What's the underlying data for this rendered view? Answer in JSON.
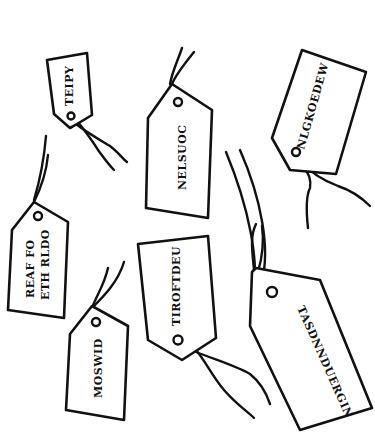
{
  "scene": {
    "description": "Hand-drawn luggage tags with scrambled words",
    "background": "#ffffff",
    "ink": "#111111"
  },
  "tags": [
    {
      "id": "tag-1",
      "lines": [
        "TEIPY"
      ]
    },
    {
      "id": "tag-2",
      "lines": [
        "NELSUOC"
      ]
    },
    {
      "id": "tag-3",
      "lines": [
        "NLGKOEDEW"
      ]
    },
    {
      "id": "tag-4",
      "lines": [
        "REAF FO",
        "ETH RLDO"
      ]
    },
    {
      "id": "tag-5",
      "lines": [
        "TIROFTDEU"
      ]
    },
    {
      "id": "tag-6",
      "lines": [
        "MOSWID"
      ]
    },
    {
      "id": "tag-7",
      "lines": [
        "TASDNNDUERGIN"
      ]
    }
  ]
}
